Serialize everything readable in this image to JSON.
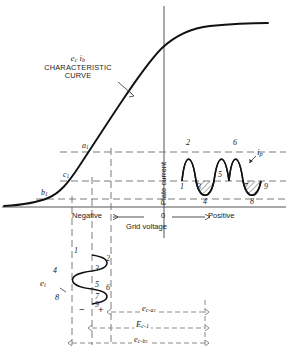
{
  "figure": {
    "kind": "vacuum-tube-transfer-characteristic",
    "curve_label_line1": "e",
    "curve_label_line1_sub": "c",
    "curve_label_line1b": "i",
    "curve_label_line1b_sub": "b",
    "curve_label_line2": "CHARACTERISTIC",
    "curve_label_line3": "CURVE"
  },
  "axes": {
    "x_title": "Grid voltage",
    "x_left": "Negative",
    "x_origin": "0",
    "x_right": "Positive",
    "y_title": "Plate current"
  },
  "operating_points": [
    {
      "id": "a1",
      "base": "a",
      "sub": "1"
    },
    {
      "id": "c1",
      "base": "c",
      "sub": "1"
    },
    {
      "id": "b1",
      "base": "b",
      "sub": "1"
    }
  ],
  "plate_wave": {
    "symbol_base": "i",
    "symbol_sub": "p",
    "markers": [
      "1",
      "2",
      "3",
      "4",
      "5",
      "6",
      "7",
      "8",
      "9"
    ]
  },
  "grid_wave": {
    "symbol_base": "e",
    "symbol_sub": "i",
    "markers": [
      "1",
      "2",
      "3",
      "4",
      "5",
      "6",
      "7",
      "8",
      "9"
    ]
  },
  "polarity": {
    "minus": "−",
    "plus": "+"
  },
  "dimensions": [
    {
      "base": "e",
      "sub": "c-a",
      "sub2": "1"
    },
    {
      "base": "E",
      "sub": "c-1",
      "sub2": ""
    },
    {
      "base": "e",
      "sub": "c-b",
      "sub2": "1"
    }
  ],
  "colors": {
    "ink": "#1a1a1a",
    "curve": "#111111",
    "dashed": "#6e6e6e",
    "axis": "#555555",
    "hatch": "#333333"
  }
}
